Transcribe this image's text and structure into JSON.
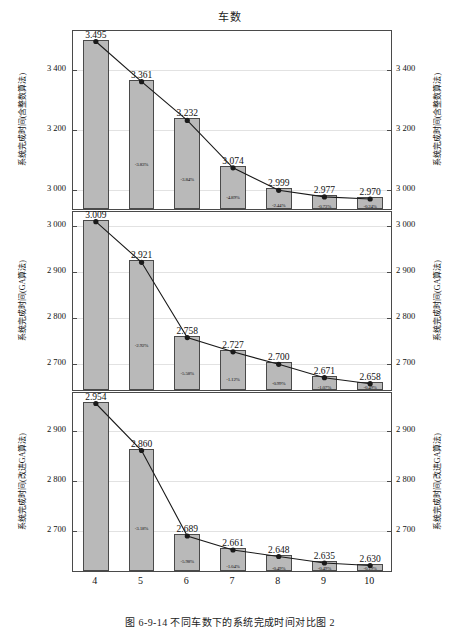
{
  "figure": {
    "title": "车数",
    "caption": "图 6-9-14  不同车数下的系统完成时间对比图 2",
    "bar_color": "#b9b9b9",
    "line_color": "#1a1a1a",
    "grid_color": "#e2e2e2"
  },
  "xaxis": {
    "categories": [
      "4",
      "5",
      "6",
      "7",
      "8",
      "9",
      "10"
    ]
  },
  "chart_data": [
    {
      "type": "bar",
      "id": "panel-1",
      "title": "车数",
      "xlabel": "",
      "ylabel": "系统完成时间(含整数算法)",
      "ylabel_right": "系统完成时间(含整数算法)",
      "categories": [
        "4",
        "5",
        "6",
        "7",
        "8",
        "9",
        "10"
      ],
      "values": [
        3495,
        3361,
        3232,
        3074,
        2999,
        2977,
        2970
      ],
      "value_labels": [
        "3.495",
        "3.361",
        "3.232",
        "3.074",
        "2.999",
        "2.977",
        "2.970"
      ],
      "pct_labels": [
        "",
        "-3.83%",
        "-3.84%",
        "-4.89%",
        "-2.44%",
        "-0.73%",
        "-0.24%"
      ],
      "ylim": [
        2930,
        3530
      ],
      "yticks": [
        3000,
        3200,
        3400
      ],
      "ytick_labels": [
        "3 000",
        "3 200",
        "3 400"
      ],
      "grid": true,
      "legend": "none",
      "series": [
        {
          "name": "系统完成时间(含整数算法)",
          "values": [
            3495,
            3361,
            3232,
            3074,
            2999,
            2977,
            2970
          ]
        }
      ]
    },
    {
      "type": "bar",
      "id": "panel-2",
      "title": "",
      "xlabel": "",
      "ylabel": "系统完成时间(GA算法)",
      "ylabel_right": "系统完成时间(GA算法)",
      "categories": [
        "4",
        "5",
        "6",
        "7",
        "8",
        "9",
        "10"
      ],
      "values": [
        3009,
        2921,
        2758,
        2727,
        2700,
        2671,
        2658
      ],
      "value_labels": [
        "3.009",
        "2.921",
        "2.758",
        "2.727",
        "2.700",
        "2.671",
        "2.658"
      ],
      "pct_labels": [
        "",
        "-2.92%",
        "-5.58%",
        "-1.12%",
        "-0.99%",
        "-1.07%",
        "-0.49%"
      ],
      "ylim": [
        2640,
        3030
      ],
      "yticks": [
        2700,
        2800,
        2900,
        3000
      ],
      "ytick_labels": [
        "2 700",
        "2 800",
        "2 900",
        "3 000"
      ],
      "grid": true,
      "legend": "none",
      "series": [
        {
          "name": "系统完成时间(GA算法)",
          "values": [
            3009,
            2921,
            2758,
            2727,
            2700,
            2671,
            2658
          ]
        }
      ]
    },
    {
      "type": "bar",
      "id": "panel-3",
      "title": "",
      "xlabel": "车数",
      "ylabel": "系统完成时间(改进GA算法)",
      "ylabel_right": "系统完成时间(改进GA算法)",
      "categories": [
        "4",
        "5",
        "6",
        "7",
        "8",
        "9",
        "10"
      ],
      "values": [
        2954,
        2860,
        2689,
        2661,
        2648,
        2635,
        2630
      ],
      "value_labels": [
        "2.954",
        "2.860",
        "2.689",
        "2.661",
        "2.648",
        "2.635",
        "2.630"
      ],
      "pct_labels": [
        "",
        "-3.18%",
        "-5.98%",
        "-1.04%",
        "-0.49%",
        "-0.49%",
        "-0.19%"
      ],
      "ylim": [
        2615,
        2975
      ],
      "yticks": [
        2700,
        2800,
        2900
      ],
      "ytick_labels": [
        "2 700",
        "2 800",
        "2 900"
      ],
      "grid": true,
      "legend": "none",
      "series": [
        {
          "name": "系统完成时间(改进GA算法)",
          "values": [
            2954,
            2860,
            2689,
            2661,
            2648,
            2635,
            2630
          ]
        }
      ]
    }
  ]
}
